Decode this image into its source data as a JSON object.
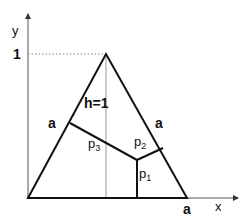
{
  "diagram": {
    "axes": {
      "x_label": "x",
      "y_label": "y",
      "y_tick": "1"
    },
    "triangle": {
      "side_labels": {
        "left": "a",
        "right": "a",
        "bottom": "a"
      },
      "height_label": "h=1"
    },
    "perpendiculars": {
      "p1": {
        "base": "p",
        "sub": "1"
      },
      "p2": {
        "base": "p",
        "sub": "2"
      },
      "p3": {
        "base": "p",
        "sub": "3"
      }
    },
    "colors": {
      "line": "#111111",
      "axis": "#333333",
      "guide": "#888888"
    }
  }
}
